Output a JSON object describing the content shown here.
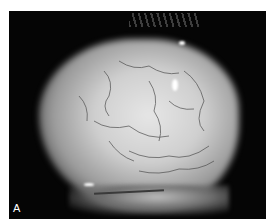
{
  "figure": {
    "panel_label": "A",
    "colors": {
      "background": "#050505",
      "border": "#ffffff",
      "tissue": "#d8d8d8",
      "vessels": "#4a4a4a",
      "label": "#ffffff"
    }
  }
}
